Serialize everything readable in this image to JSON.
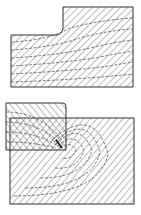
{
  "figure": {
    "colors": {
      "line": "#333333",
      "hatch": "#555555",
      "background": "#ffffff"
    },
    "panels": [
      {
        "id": "top",
        "label": "",
        "shape": "stepped-block"
      },
      {
        "id": "bottom",
        "label": "",
        "shape": "tool-and-workpiece"
      }
    ]
  }
}
